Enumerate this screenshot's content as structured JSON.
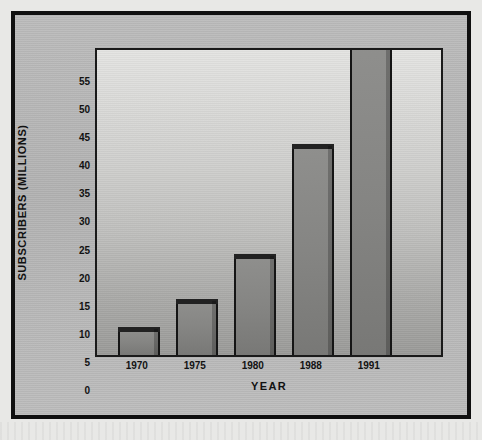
{
  "chart_data": {
    "type": "bar",
    "title": "",
    "xlabel": "YEAR",
    "ylabel": "SUBSCRIBERS (MILLIONS)",
    "categories": [
      "1970",
      "1975",
      "1980",
      "1988",
      "1991"
    ],
    "values": [
      5,
      10,
      18,
      37.5,
      55
    ],
    "value_notes": [
      "1970: 5",
      "1975: 10",
      "1980: 18",
      "1988: 37.5",
      "1991: exceeds axis maximum, bar clipped at 55"
    ],
    "clipped": [
      false,
      false,
      false,
      false,
      true
    ],
    "ylim": [
      0,
      55
    ],
    "yticks": [
      0,
      5,
      10,
      15,
      20,
      25,
      30,
      35,
      40,
      45,
      50,
      55
    ],
    "ytick_labels": [
      "0",
      "5",
      "10",
      "15",
      "20",
      "25",
      "30",
      "35",
      "40",
      "45",
      "50",
      "55"
    ],
    "grid": false,
    "legend": null,
    "colors": {
      "bar_fill": "#858583",
      "bar_edge": "#151515",
      "bar_cap": "#222222",
      "plot_bg_top": "#e4e4e2",
      "plot_bg_bottom": "#9b9b99",
      "panel_bg": "#b6b6b6",
      "frame": "#101010",
      "text": "#121212"
    }
  }
}
